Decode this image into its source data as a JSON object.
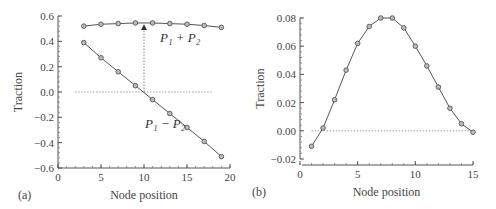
{
  "chart_data": [
    {
      "type": "line",
      "panel_label": "(a)",
      "xlabel": "Node position",
      "ylabel": "Traction",
      "xlim": [
        0,
        20
      ],
      "ylim": [
        -0.6,
        0.6
      ],
      "xticks": [
        "0",
        "5",
        "10",
        "15",
        "20"
      ],
      "yticks": [
        "0.6",
        "0.4",
        "0.2",
        "0.0",
        "−0.2",
        "−0.4",
        "−0.6"
      ],
      "x": [
        3,
        5,
        7,
        9,
        11,
        13,
        15,
        17,
        19
      ],
      "series": [
        {
          "name": "P1 + P2",
          "values": [
            0.52,
            0.535,
            0.54,
            0.545,
            0.545,
            0.54,
            0.535,
            0.525,
            0.51
          ]
        },
        {
          "name": "P1 − P2",
          "values": [
            0.39,
            0.27,
            0.16,
            0.05,
            -0.06,
            -0.17,
            -0.28,
            -0.39,
            -0.51
          ]
        }
      ],
      "annotations": {
        "sum": "P₁ + P₂",
        "diff": "P₁ − P₂"
      },
      "reference_line_y": 0.0,
      "arrow_x": 10
    },
    {
      "type": "line",
      "panel_label": "(b)",
      "xlabel": "Node position",
      "ylabel": "Traction",
      "xlim": [
        0,
        15
      ],
      "ylim": [
        -0.02,
        0.08
      ],
      "xticks": [
        "0",
        "5",
        "10",
        "15"
      ],
      "yticks": [
        "0.08",
        "0.06",
        "0.04",
        "0.02",
        "0.00",
        "−0.02"
      ],
      "x": [
        1,
        2,
        3,
        4,
        5,
        6,
        7,
        8,
        9,
        10,
        11,
        12,
        13,
        14,
        15
      ],
      "series": [
        {
          "name": "Traction",
          "values": [
            -0.011,
            0.002,
            0.022,
            0.043,
            0.062,
            0.074,
            0.08,
            0.08,
            0.073,
            0.06,
            0.046,
            0.031,
            0.016,
            0.005,
            -0.001
          ]
        }
      ],
      "reference_line_y": 0.0
    }
  ]
}
